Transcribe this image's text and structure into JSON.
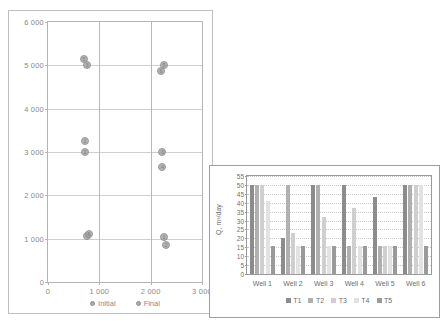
{
  "scatter_chart": {
    "title": "",
    "legend": [
      {
        "label": "Initial",
        "color": "#a9a9a9"
      },
      {
        "label": "Final",
        "color": "#a9a9a9"
      }
    ],
    "xlabel": "",
    "ylabel": "",
    "xticks": [
      "0",
      "1 000",
      "2 000",
      "3 000"
    ],
    "yticks": [
      "0",
      "1 000",
      "2 000",
      "3 000",
      "4 000",
      "5 000",
      "6 000"
    ]
  },
  "bar_chart_labels": {
    "ylabel": "Q, m³/day",
    "yticks": [
      "0",
      "5",
      "10",
      "15",
      "20",
      "25",
      "30",
      "35",
      "40",
      "45",
      "50",
      "55"
    ],
    "legend": [
      {
        "label": "T1",
        "color": "#8c8c8c"
      },
      {
        "label": "T2",
        "color": "#b0b0b0"
      },
      {
        "label": "T3",
        "color": "#cfcfcf"
      },
      {
        "label": "T4",
        "color": "#e2e2e2"
      },
      {
        "label": "T5",
        "color": "#9a9a9a"
      }
    ]
  },
  "chart_data": [
    {
      "type": "scatter",
      "title": "",
      "xlabel": "",
      "ylabel": "",
      "xlim": [
        0,
        3000
      ],
      "ylim": [
        0,
        6000
      ],
      "xticks": [
        0,
        1000,
        2000,
        3000
      ],
      "yticks": [
        0,
        1000,
        2000,
        3000,
        4000,
        5000,
        6000
      ],
      "grid": true,
      "legend_position": "bottom",
      "series": [
        {
          "name": "Initial",
          "color": "#a9a9a9",
          "points": [
            {
              "x": 700,
              "y": 5150,
              "label": "5"
            },
            {
              "x": 760,
              "y": 5000,
              "label": "3"
            },
            {
              "x": 720,
              "y": 3250,
              "label": "1"
            },
            {
              "x": 720,
              "y": 3000,
              "label": "2"
            },
            {
              "x": 760,
              "y": 1060,
              "label": "4"
            },
            {
              "x": 800,
              "y": 1100,
              "label": "6"
            }
          ]
        },
        {
          "name": "Final",
          "color": "#a9a9a9",
          "points": [
            {
              "x": 2260,
              "y": 5000,
              "label": "5"
            },
            {
              "x": 2200,
              "y": 4880,
              "label": "6"
            },
            {
              "x": 2230,
              "y": 3000,
              "label": "3"
            },
            {
              "x": 2230,
              "y": 2660,
              "label": "4"
            },
            {
              "x": 2260,
              "y": 1040,
              "label": "1"
            },
            {
              "x": 2300,
              "y": 860,
              "label": "2"
            }
          ]
        }
      ]
    },
    {
      "type": "bar",
      "title": "",
      "xlabel": "",
      "ylabel": "Q, m³/day",
      "ylim": [
        0,
        55
      ],
      "yticks": [
        0,
        5,
        10,
        15,
        20,
        25,
        30,
        35,
        40,
        45,
        50,
        55
      ],
      "grid": true,
      "legend_position": "bottom",
      "categories": [
        "Well 1",
        "Well 2",
        "Well 3",
        "Well 4",
        "Well 5",
        "Well 6"
      ],
      "series": [
        {
          "name": "T1",
          "color": "#8c8c8c",
          "values": [
            50,
            20,
            50,
            50,
            43,
            50
          ]
        },
        {
          "name": "T2",
          "color": "#b0b0b0",
          "values": [
            50,
            50,
            50,
            16,
            16,
            50
          ]
        },
        {
          "name": "T3",
          "color": "#cfcfcf",
          "values": [
            50,
            23,
            32,
            37,
            16,
            50
          ]
        },
        {
          "name": "T4",
          "color": "#e2e2e2",
          "values": [
            41,
            16,
            16,
            16,
            16,
            50
          ]
        },
        {
          "name": "T5",
          "color": "#9a9a9a",
          "values": [
            16,
            16,
            16,
            16,
            16,
            16
          ]
        }
      ]
    }
  ]
}
